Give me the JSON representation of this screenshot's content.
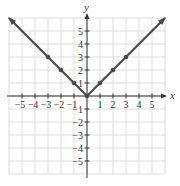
{
  "chart_data": {
    "type": "line",
    "title": "",
    "xlabel": "x",
    "ylabel": "y",
    "function": "y = |x|",
    "xlim": [
      -6,
      6
    ],
    "ylim": [
      -6,
      6
    ],
    "grid": true,
    "x_ticks": [
      -5,
      -4,
      -3,
      -2,
      -1,
      1,
      2,
      3,
      4,
      5
    ],
    "y_ticks": [
      -5,
      -4,
      -3,
      -2,
      -1,
      1,
      2,
      3,
      4,
      5
    ],
    "x_tick_labels": [
      "−5",
      "−4",
      "−3",
      "−2",
      "−1",
      "1",
      "2",
      "3",
      "4",
      "5"
    ],
    "y_tick_labels": [
      "−5",
      "−4",
      "−3",
      "−2",
      "−1",
      "1",
      "2",
      "3",
      "4",
      "5"
    ],
    "series": [
      {
        "name": "y = |x|",
        "points": [
          [
            -6,
            6
          ],
          [
            0,
            0
          ],
          [
            6,
            6
          ]
        ],
        "marked_points": [
          [
            -3,
            3
          ],
          [
            -2,
            2
          ],
          [
            -1,
            1
          ],
          [
            0,
            0
          ],
          [
            1,
            1
          ],
          [
            2,
            2
          ],
          [
            3,
            3
          ]
        ],
        "arrows_at_ends": true
      }
    ],
    "colors": {
      "line": "#4a4a4a",
      "grid": "#d4d4d4",
      "axis": "#333333"
    }
  }
}
